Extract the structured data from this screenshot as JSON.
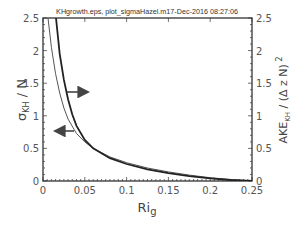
{
  "chart_data": {
    "type": "line",
    "title": "KHgrowth.eps, plot_sigmaHazel.m17-Dec-2016 08:27:06",
    "xlabel": "Ri_g",
    "ylabel_left": "σ_KH / N",
    "ylabel_right": "AKE_KH / (Δ z N)^2",
    "xlim": [
      0,
      0.25
    ],
    "ylim_left": [
      0,
      2.5
    ],
    "ylim_right": [
      0,
      2.5
    ],
    "xticks": [
      "0",
      "0.05",
      "0.1",
      "0.15",
      "0.2",
      "0.25"
    ],
    "yticks_left": [
      "0",
      "0.5",
      "1",
      "1.5",
      "2",
      "2.5"
    ],
    "yticks_right": [
      "0",
      "0.5",
      "1",
      "1.5",
      "2",
      "2.5"
    ],
    "grid": false,
    "series": [
      {
        "name": "σ_KH / N (left axis)",
        "axis": "left",
        "style": "thin",
        "x": [
          0.006,
          0.01,
          0.015,
          0.02,
          0.025,
          0.03,
          0.04,
          0.05,
          0.06,
          0.08,
          0.1,
          0.125,
          0.15,
          0.175,
          0.2,
          0.225,
          0.25
        ],
        "y": [
          2.5,
          2.05,
          1.65,
          1.35,
          1.12,
          0.95,
          0.73,
          0.6,
          0.5,
          0.37,
          0.28,
          0.2,
          0.14,
          0.09,
          0.05,
          0.02,
          0.0
        ]
      },
      {
        "name": "AKE_KH / (Δz N)^2 (right axis)",
        "axis": "right",
        "style": "thick",
        "x": [
          0.0155,
          0.02,
          0.025,
          0.03,
          0.035,
          0.04,
          0.05,
          0.06,
          0.08,
          0.1,
          0.125,
          0.15,
          0.175,
          0.2,
          0.225,
          0.25
        ],
        "y": [
          2.5,
          1.95,
          1.55,
          1.25,
          1.02,
          0.85,
          0.63,
          0.5,
          0.35,
          0.26,
          0.18,
          0.12,
          0.075,
          0.04,
          0.015,
          0.0
        ]
      }
    ],
    "annotations": [
      {
        "type": "arrow",
        "direction": "right",
        "meaning": "thick curve uses right axis"
      },
      {
        "type": "arrow",
        "direction": "left",
        "meaning": "thin curve uses left axis"
      }
    ]
  }
}
